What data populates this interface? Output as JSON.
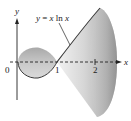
{
  "figure": {
    "curve_label": "y = x ln x",
    "curve_label_parts": {
      "lhs": "y",
      "eq": " = ",
      "x": "x",
      "ln": " ln ",
      "x2": "x"
    },
    "x_axis_label": "x",
    "y_axis_label": "y",
    "ticks": [
      {
        "value": "0",
        "x": 8
      },
      {
        "value": "1",
        "x": 57
      },
      {
        "value": "2",
        "x": 95
      }
    ],
    "colors": {
      "surface_dark": "#8c8c8c",
      "surface_light": "#e6e6e6",
      "outline": "#3a3a3a",
      "axis": "#222222"
    }
  }
}
